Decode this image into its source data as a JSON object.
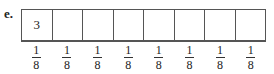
{
  "label": "e.",
  "cells": [
    "3",
    "",
    "",
    "",
    "",
    "",
    "",
    ""
  ],
  "fractions": [
    {
      "num": "1",
      "den": "8"
    },
    {
      "num": "1",
      "den": "8"
    },
    {
      "num": "1",
      "den": "8"
    },
    {
      "num": "1",
      "den": "8"
    },
    {
      "num": "1",
      "den": "8"
    },
    {
      "num": "1",
      "den": "8"
    },
    {
      "num": "1",
      "den": "8"
    },
    {
      "num": "1",
      "den": "8"
    }
  ]
}
